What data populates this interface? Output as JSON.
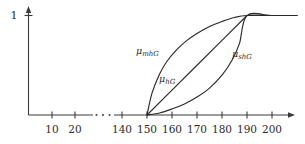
{
  "figure": {
    "title": "",
    "background_color": "#ffffff",
    "line_color": "#2b2b2b",
    "axis_color": "#3a3a3a"
  },
  "axes": {
    "y_axis": {
      "label": "",
      "tick_labels": [
        "1"
      ],
      "tick_values": [
        1
      ],
      "range": [
        0,
        1.1
      ]
    },
    "x_axis": {
      "label": "",
      "tick_labels": [
        "10",
        "20",
        "140",
        "150",
        "160",
        "170",
        "180",
        "190",
        "200"
      ],
      "tick_values": [
        10,
        20,
        140,
        150,
        160,
        170,
        180,
        190,
        200
      ],
      "break_marker": "· · ·",
      "break_between": [
        20,
        140
      ]
    }
  },
  "curve_labels": [
    {
      "name": "mu-mhG",
      "base": "μ",
      "sub": "mhG",
      "x": 136,
      "y": 50
    },
    {
      "name": "mu-hG",
      "base": "μ",
      "sub": "hG",
      "x": 159,
      "y": 78
    },
    {
      "name": "mu-shG",
      "base": "μ",
      "sub": "shG",
      "x": 232,
      "y": 53
    }
  ],
  "chart_data": {
    "type": "line",
    "title": "",
    "xlabel": "",
    "ylabel": "",
    "xlim": [
      0,
      210
    ],
    "ylim": [
      0,
      1.05
    ],
    "grid": false,
    "legend": "inline-annotations",
    "x_axis_break": {
      "from": 20,
      "to": 140,
      "marker": "dots"
    },
    "x_ticks": [
      10,
      20,
      140,
      150,
      160,
      170,
      180,
      190,
      200
    ],
    "y_ticks": [
      1
    ],
    "series": [
      {
        "name": "μ_mhG",
        "label": "μmhG",
        "shape": "concave-increasing",
        "description": "more-or-less high (concave, rises fast then flattens)",
        "x": [
          150,
          152,
          155,
          158,
          162,
          166,
          170,
          175,
          180,
          185,
          190,
          200,
          210
        ],
        "y": [
          0.0,
          0.22,
          0.41,
          0.54,
          0.66,
          0.75,
          0.82,
          0.89,
          0.94,
          0.98,
          1.0,
          1.0,
          1.0
        ]
      },
      {
        "name": "μ_hG",
        "label": "μhG",
        "shape": "linear-increasing",
        "description": "high (linear ramp from 150 to 190)",
        "x": [
          150,
          160,
          170,
          180,
          190,
          200,
          210
        ],
        "y": [
          0.0,
          0.25,
          0.5,
          0.75,
          1.0,
          1.0,
          1.0
        ]
      },
      {
        "name": "μ_shG",
        "label": "μshG",
        "shape": "convex-increasing",
        "description": "strongly high (convex, flat then rises fast)",
        "x": [
          150,
          155,
          160,
          165,
          170,
          175,
          180,
          184,
          187,
          190,
          200,
          210
        ],
        "y": [
          0.0,
          0.02,
          0.06,
          0.11,
          0.18,
          0.27,
          0.4,
          0.55,
          0.72,
          1.0,
          1.0,
          1.0
        ]
      }
    ]
  }
}
